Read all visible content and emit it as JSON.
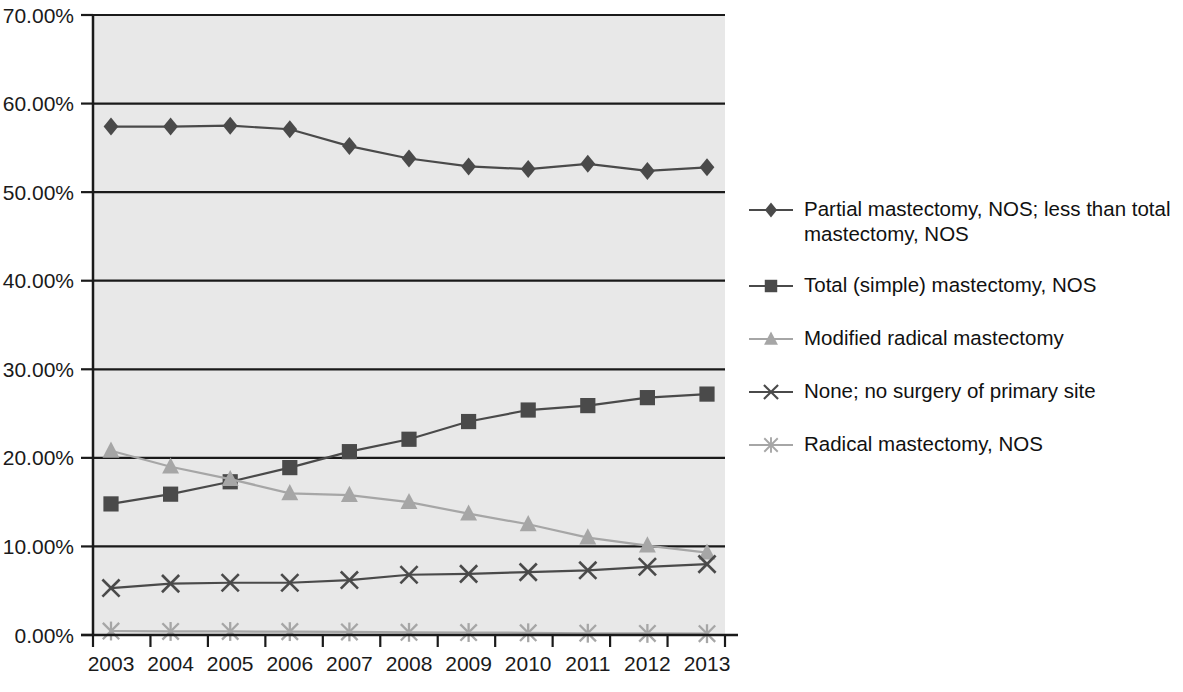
{
  "chart_data": {
    "type": "line",
    "title": "",
    "xlabel": "",
    "ylabel": "",
    "categories": [
      "2003",
      "2004",
      "2005",
      "2006",
      "2007",
      "2008",
      "2009",
      "2010",
      "2011",
      "2012",
      "2013"
    ],
    "ylim": [
      0,
      70
    ],
    "yticks": [
      0,
      10,
      20,
      30,
      40,
      50,
      60,
      70
    ],
    "ytick_labels": [
      "0.00%",
      "10.00%",
      "20.00%",
      "30.00%",
      "40.00%",
      "50.00%",
      "60.00%",
      "70.00%"
    ],
    "grid": "horizontal",
    "legend_position": "right",
    "value_suffix": "%",
    "series": [
      {
        "name": "Partial mastectomy, NOS; less than total mastectomy, NOS",
        "marker": "diamond",
        "color": "#4a4a4a",
        "values": [
          57.4,
          57.4,
          57.5,
          57.1,
          55.2,
          53.8,
          52.9,
          52.6,
          53.2,
          52.4,
          52.8
        ]
      },
      {
        "name": "Total (simple) mastectomy, NOS",
        "marker": "square",
        "color": "#4a4a4a",
        "values": [
          14.8,
          15.9,
          17.3,
          18.9,
          20.7,
          22.1,
          24.1,
          25.4,
          25.9,
          26.8,
          27.2
        ]
      },
      {
        "name": "Modified radical mastectomy",
        "marker": "triangle",
        "color": "#a6a6a6",
        "values": [
          20.8,
          19.0,
          17.6,
          16.0,
          15.8,
          15.0,
          13.7,
          12.5,
          11.0,
          10.1,
          9.3
        ]
      },
      {
        "name": "None; no surgery of primary site",
        "marker": "cross",
        "color": "#4a4a4a",
        "values": [
          5.3,
          5.8,
          5.9,
          5.9,
          6.2,
          6.8,
          6.9,
          7.1,
          7.3,
          7.7,
          8.0
        ]
      },
      {
        "name": "Radical mastectomy, NOS",
        "marker": "asterisk",
        "color": "#a6a6a6",
        "values": [
          0.45,
          0.4,
          0.4,
          0.38,
          0.35,
          0.3,
          0.28,
          0.25,
          0.2,
          0.18,
          0.15
        ]
      }
    ]
  },
  "legend": {
    "items": [
      {
        "label": "Partial mastectomy, NOS; less than total mastectomy, NOS",
        "marker": "diamond",
        "color": "#4a4a4a"
      },
      {
        "label": "Total (simple) mastectomy, NOS",
        "marker": "square",
        "color": "#4a4a4a"
      },
      {
        "label": "Modified radical mastectomy",
        "marker": "triangle",
        "color": "#a6a6a6"
      },
      {
        "label": "None; no surgery of primary site",
        "marker": "cross",
        "color": "#4a4a4a"
      },
      {
        "label": "Radical mastectomy, NOS",
        "marker": "asterisk",
        "color": "#a6a6a6"
      }
    ]
  },
  "colors": {
    "plot_background": "#e8e8e8",
    "axis": "#1a1a1a",
    "gridline": "#1a1a1a",
    "dark_series": "#4a4a4a",
    "light_series": "#a6a6a6"
  }
}
